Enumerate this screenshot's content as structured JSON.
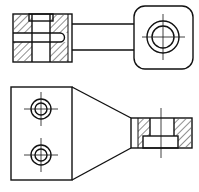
{
  "drawing": {
    "type": "engineering-orthographic",
    "views": [
      "top-view-section",
      "front-view"
    ],
    "colors": {
      "line": "#111111",
      "background": "#ffffff",
      "hatch": "#222222"
    },
    "line_width": 1.4,
    "top_view": {
      "body_left": {
        "x": 13,
        "y": 14,
        "w": 59,
        "h": 48
      },
      "slot": {
        "y1": 33,
        "y2": 42
      },
      "arm": {
        "x1": 72,
        "x2": 134,
        "y_top": 24,
        "y_bottom": 50
      },
      "boss": {
        "x": 134,
        "y": 6,
        "w": 59,
        "h": 63,
        "r": 11
      },
      "boss_circle": {
        "cx": 163,
        "cy": 37,
        "r_outer": 16,
        "r_inner": 11
      }
    },
    "front_view": {
      "plate": {
        "x": 11,
        "y": 87,
        "w": 61,
        "h": 93
      },
      "holes": [
        {
          "cx": 41,
          "cy": 109,
          "r_outer": 10,
          "r_inner": 6
        },
        {
          "cx": 41,
          "cy": 155,
          "r_outer": 10,
          "r_inner": 6
        }
      ],
      "taper": {
        "x1": 72,
        "x2": 131,
        "y_top_start": 87,
        "y_top_end": 118,
        "y_bot_start": 180,
        "y_bot_end": 148
      },
      "section": {
        "x": 131,
        "y": 118,
        "w": 61,
        "h": 30,
        "bore_x1": 150,
        "bore_x2": 174,
        "cb_x1": 143,
        "cb_x2": 178,
        "cb_y": 136,
        "axis_x": 161
      }
    }
  }
}
